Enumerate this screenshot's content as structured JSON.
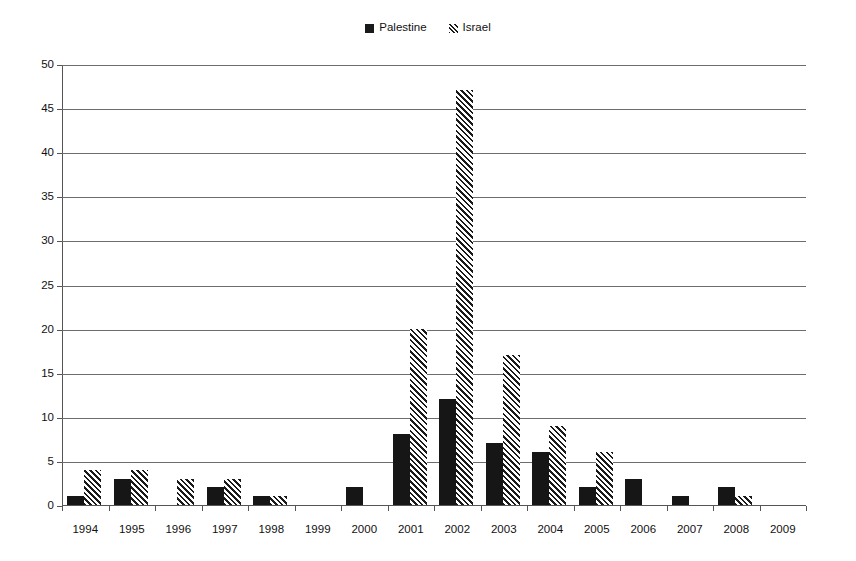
{
  "chart_data": {
    "type": "bar",
    "title": "",
    "subtitle": "",
    "xlabel": "",
    "ylabel": "",
    "ylim": [
      0,
      50
    ],
    "ytick_step": 5,
    "yticks": [
      0,
      5,
      10,
      15,
      20,
      25,
      30,
      35,
      40,
      45,
      50
    ],
    "grid": true,
    "grid_axis": "y",
    "legend_position": "top-center",
    "categories": [
      "1994",
      "1995",
      "1996",
      "1997",
      "1998",
      "1999",
      "2000",
      "2001",
      "2002",
      "2003",
      "2004",
      "2005",
      "2006",
      "2007",
      "2008",
      "2009"
    ],
    "series": [
      {
        "name": "Palestine",
        "style": "solid",
        "color": "#161616",
        "values": [
          1,
          3,
          0,
          2,
          1,
          0,
          2,
          8,
          12,
          7,
          6,
          2,
          3,
          1,
          2,
          0
        ]
      },
      {
        "name": "Israel",
        "style": "diagonal-hatch",
        "color": "#1a1a1a",
        "values": [
          4,
          4,
          3,
          3,
          1,
          0,
          0,
          20,
          47,
          17,
          9,
          6,
          0,
          0,
          1,
          0
        ]
      }
    ]
  },
  "legend": {
    "entries": [
      {
        "label": "Palestine",
        "swatch": "solid-square-icon"
      },
      {
        "label": "Israel",
        "swatch": "diagonal-hatch-square-icon"
      }
    ]
  }
}
